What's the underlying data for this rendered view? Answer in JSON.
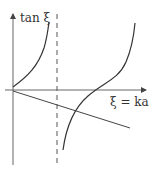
{
  "diagram": {
    "y_label": "tan ξ",
    "x_label": "ξ = ka",
    "elements": [
      "vertical-axis",
      "horizontal-axis",
      "tan-branch-left",
      "tan-branch-right",
      "asymptote-dashed",
      "descending-line"
    ]
  }
}
